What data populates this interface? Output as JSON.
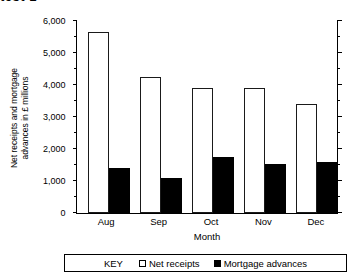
{
  "page": {
    "top_artifact_text": "test 1"
  },
  "legend": {
    "key_label": "KEY",
    "items": [
      {
        "label": "Net  receipts",
        "swatch": "light",
        "color": "#ffffff"
      },
      {
        "label": "Mortgage advances",
        "swatch": "dark",
        "color": "#000000"
      }
    ]
  },
  "axes": {
    "y_title_line1": "Net receipts and mortgage",
    "y_title_line2": "advances in £ millions",
    "x_title": "Month",
    "y_ticks": [
      "0",
      "1,000",
      "2,000",
      "3,000",
      "4,000",
      "5,000",
      "6,000"
    ],
    "y_minor_ticks": [
      "500",
      "1,500",
      "2,500",
      "3,500",
      "4,500",
      "5,500"
    ]
  },
  "chart_data": {
    "type": "bar",
    "title": "",
    "xlabel": "Month",
    "ylabel": "Net receipts and mortgage advances in £ millions",
    "categories": [
      "Aug",
      "Sep",
      "Oct",
      "Nov",
      "Dec"
    ],
    "series": [
      {
        "name": "Net  receipts",
        "color": "#ffffff",
        "values": [
          5650,
          4250,
          3900,
          3900,
          3400
        ]
      },
      {
        "name": "Mortgage advances",
        "color": "#000000",
        "values": [
          1400,
          1100,
          1750,
          1530,
          1580
        ]
      }
    ],
    "ylim": [
      0,
      6000
    ],
    "y_tick_interval": 1000,
    "y_minor_tick_interval": 500,
    "grid": false,
    "legend_position": "bottom"
  }
}
